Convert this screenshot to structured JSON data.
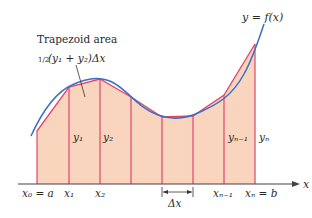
{
  "figure": {
    "curve_label": "y = f(x)",
    "annotation": {
      "title": "Trapezoid area",
      "formula_half": "1/2",
      "formula_rest": "(y₁ + y₂)Δx"
    },
    "axis_label": "x",
    "x_labels": [
      "x₀ = a",
      "x₁",
      "x₂",
      "xₙ₋₁",
      "xₙ = b"
    ],
    "y_labels": [
      "y₁",
      "y₂",
      "yₙ₋₁",
      "yₙ"
    ],
    "dx_label": "Δx",
    "colors": {
      "curve": "#3a6fc4",
      "polygon": "#e0456e",
      "fill": "#f9d5bd",
      "axis": "#444444"
    }
  }
}
